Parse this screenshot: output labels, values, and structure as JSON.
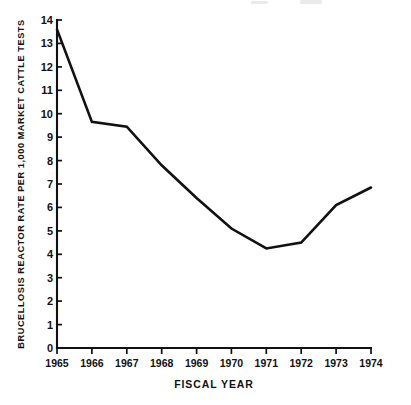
{
  "chart_data": {
    "type": "line",
    "title": "",
    "xlabel": "FISCAL YEAR",
    "ylabel": "BRUCELLOSIS REACTOR RATE PER 1,000 MARKET CATTLE TESTS",
    "categories": [
      "1965",
      "1966",
      "1967",
      "1968",
      "1969",
      "1970",
      "1971",
      "1972",
      "1973",
      "1974"
    ],
    "x": [
      1965,
      1966,
      1967,
      1968,
      1969,
      1970,
      1971,
      1972,
      1973,
      1974
    ],
    "values": [
      13.6,
      9.65,
      9.45,
      7.8,
      6.4,
      5.1,
      4.25,
      4.5,
      6.1,
      6.85
    ],
    "series": [
      {
        "name": "Brucellosis reactor rate",
        "values": [
          13.6,
          9.65,
          9.45,
          7.8,
          6.4,
          5.1,
          4.25,
          4.5,
          6.1,
          6.85
        ]
      }
    ],
    "ylim": [
      0,
      14
    ],
    "xlim": [
      1965,
      1974
    ],
    "y_ticks": [
      "0",
      "1",
      "2",
      "3",
      "4",
      "5",
      "6",
      "7",
      "8",
      "9",
      "10",
      "11",
      "12",
      "13",
      "14"
    ],
    "y_tick_values": [
      0,
      1,
      2,
      3,
      4,
      5,
      6,
      7,
      8,
      9,
      10,
      11,
      12,
      13,
      14
    ],
    "x_ticks": [
      "1965",
      "1966",
      "1967",
      "1968",
      "1969",
      "1970",
      "1971",
      "1972",
      "1973",
      "1974"
    ],
    "grid": false,
    "legend": false,
    "legend_position": "none",
    "line_color": "#111111",
    "background_color": "#ffffff"
  }
}
